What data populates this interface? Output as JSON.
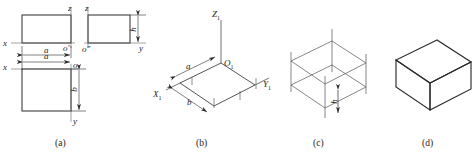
{
  "figure": {
    "stroke_color": "#2b2b2b",
    "thin_stroke_color": "#555555",
    "background": "#ffffff"
  },
  "panels": [
    {
      "id": "a",
      "caption": "(a)",
      "description": "Three orthographic views of a rectangular block",
      "views": [
        {
          "name": "top-left-view",
          "axis_labels": [
            {
              "text": "z",
              "position": "top"
            },
            {
              "text": "x",
              "position": "left"
            },
            {
              "text": "o′",
              "position": "bottom-right"
            }
          ],
          "dimensions": [
            {
              "text": "a",
              "position": "below"
            }
          ]
        },
        {
          "name": "top-right-view",
          "axis_labels": [
            {
              "text": "z",
              "position": "top"
            },
            {
              "text": "o″",
              "position": "bottom-left"
            },
            {
              "text": "y",
              "position": "bottom-right"
            }
          ],
          "dimensions": [
            {
              "text": "h",
              "position": "right"
            }
          ]
        },
        {
          "name": "bottom-left-view",
          "axis_labels": [
            {
              "text": "x",
              "position": "left"
            },
            {
              "text": "o",
              "position": "top-right"
            },
            {
              "text": "y",
              "position": "bottom"
            }
          ],
          "dimensions": [
            {
              "text": "a",
              "position": "above"
            },
            {
              "text": "b",
              "position": "right"
            }
          ]
        }
      ]
    },
    {
      "id": "b",
      "caption": "(b)",
      "description": "Isometric axes with base parallelogram laid out",
      "axis_labels": [
        {
          "text": "Z",
          "sub": "1",
          "position": "top"
        },
        {
          "text": "O",
          "sub": "1",
          "position": "origin"
        },
        {
          "text": "Y",
          "sub": "1",
          "position": "right"
        },
        {
          "text": "X",
          "sub": "1",
          "position": "left"
        }
      ],
      "dimensions": [
        {
          "text": "a",
          "position": "upper-left-edge"
        },
        {
          "text": "b",
          "position": "lower-left-edge"
        }
      ]
    },
    {
      "id": "c",
      "caption": "(c)",
      "description": "Wireframe box with vertical height lines added",
      "dimensions": [
        {
          "text": "h",
          "position": "front-vertical-edge"
        }
      ]
    },
    {
      "id": "d",
      "caption": "(d)",
      "description": "Completed solid isometric box",
      "dimensions": []
    }
  ],
  "captions": {
    "a": "(a)",
    "b": "(b)",
    "c": "(c)",
    "d": "(d)"
  },
  "labels": {
    "a_z_top": "z",
    "a_x_left": "x",
    "a_o_prime": "o′",
    "a_dim_a_top": "a",
    "a_z_top2": "z",
    "a_o_dprime": "o″",
    "a_y_right": "y",
    "a_dim_h_right": "h",
    "a_x_left2": "x",
    "a_o": "o",
    "a_y_bottom": "y",
    "a_dim_a_bottom": "a",
    "a_dim_b_right": "b",
    "b_Z": "Z",
    "b_Z_sub": "1",
    "b_O": "O",
    "b_O_sub": "1",
    "b_Y": "Y",
    "b_Y_sub": "1",
    "b_X": "X",
    "b_X_sub": "1",
    "b_dim_a": "a",
    "b_dim_b": "b",
    "c_dim_h": "h"
  }
}
